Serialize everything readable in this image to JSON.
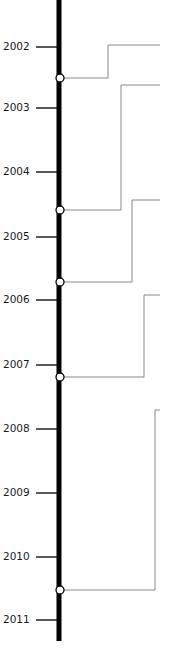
{
  "timeline": {
    "axis": {
      "x": 59,
      "top": 0,
      "bottom": 641,
      "width": 5,
      "color": "#000000"
    },
    "tick": {
      "x1": 36,
      "x2": 59,
      "color": "#222222"
    },
    "connector_color": "#888888",
    "node": {
      "radius": 4,
      "fill": "#ffffff",
      "stroke": "#000000"
    },
    "years": [
      {
        "label": "2002",
        "y": 47
      },
      {
        "label": "2003",
        "y": 108
      },
      {
        "label": "2004",
        "y": 172
      },
      {
        "label": "2005",
        "y": 237
      },
      {
        "label": "2006",
        "y": 300
      },
      {
        "label": "2007",
        "y": 365
      },
      {
        "label": "2008",
        "y": 429
      },
      {
        "label": "2009",
        "y": 493
      },
      {
        "label": "2010",
        "y": 557
      },
      {
        "label": "2011",
        "y": 620
      }
    ],
    "events": [
      {
        "node_y": 78,
        "elbow_x": 108,
        "top_y": 45,
        "end_x": 160
      },
      {
        "node_y": 210,
        "elbow_x": 121,
        "top_y": 85,
        "end_x": 160
      },
      {
        "node_y": 282,
        "elbow_x": 132,
        "top_y": 200,
        "end_x": 160
      },
      {
        "node_y": 377,
        "elbow_x": 144,
        "top_y": 295,
        "end_x": 160
      },
      {
        "node_y": 590,
        "elbow_x": 155,
        "top_y": 410,
        "end_x": 160
      }
    ]
  }
}
